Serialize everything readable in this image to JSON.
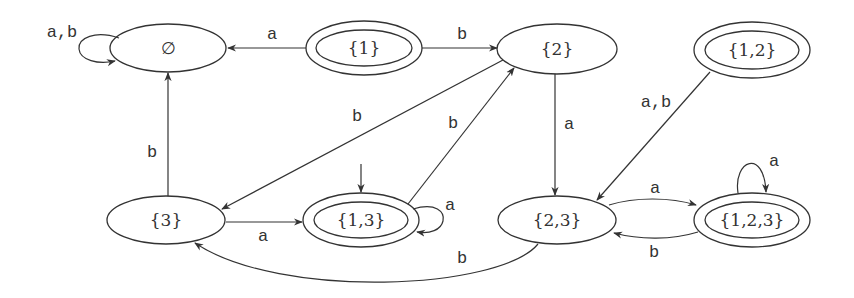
{
  "diagram": {
    "type": "deterministic finite automaton (subset construction)",
    "colors": {
      "stroke": "#333333",
      "background": "#ffffff"
    },
    "states": [
      {
        "id": "empty",
        "label": "∅",
        "accepting": false,
        "start": false,
        "cx": 168,
        "cy": 48
      },
      {
        "id": "s1",
        "label": "{1}",
        "accepting": true,
        "start": false,
        "cx": 364,
        "cy": 48
      },
      {
        "id": "s2",
        "label": "{2}",
        "accepting": false,
        "start": false,
        "cx": 557,
        "cy": 49
      },
      {
        "id": "s12",
        "label": "{1,2}",
        "accepting": true,
        "start": false,
        "cx": 752,
        "cy": 50
      },
      {
        "id": "s3",
        "label": "{3}",
        "accepting": false,
        "start": false,
        "cx": 166,
        "cy": 220
      },
      {
        "id": "s13",
        "label": "{1,3}",
        "accepting": true,
        "start": true,
        "cx": 361,
        "cy": 220
      },
      {
        "id": "s23",
        "label": "{2,3}",
        "accepting": false,
        "start": false,
        "cx": 557,
        "cy": 220
      },
      {
        "id": "s123",
        "label": "{1,2,3}",
        "accepting": true,
        "start": false,
        "cx": 752,
        "cy": 220
      }
    ],
    "transitions": [
      {
        "from": "∅",
        "to": "∅",
        "label": "a,b"
      },
      {
        "from": "{1}",
        "to": "∅",
        "label": "a"
      },
      {
        "from": "{1}",
        "to": "{2}",
        "label": "b"
      },
      {
        "from": "{2}",
        "to": "{3}",
        "label": "b"
      },
      {
        "from": "{2}",
        "to": "{2,3}",
        "label": "a"
      },
      {
        "from": "{1,2}",
        "to": "{2,3}",
        "label": "a,b"
      },
      {
        "from": "{3}",
        "to": "∅",
        "label": "b"
      },
      {
        "from": "{3}",
        "to": "{1,3}",
        "label": "a"
      },
      {
        "from": "{1,3}",
        "to": "{1,3}",
        "label": "a"
      },
      {
        "from": "{1,3}",
        "to": "{2}",
        "label": "b"
      },
      {
        "from": "{2,3}",
        "to": "{1,2,3}",
        "label": "a"
      },
      {
        "from": "{1,2,3}",
        "to": "{2,3}",
        "label": "b"
      },
      {
        "from": "{1,2,3}",
        "to": "{1,2,3}",
        "label": "a"
      },
      {
        "from": "{2,3}",
        "to": "{3}",
        "label": "b"
      }
    ]
  }
}
